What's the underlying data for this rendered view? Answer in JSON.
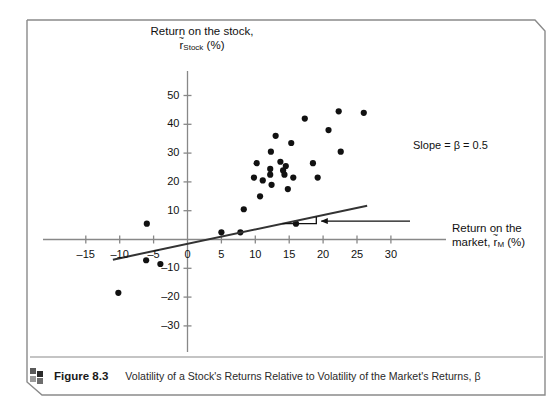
{
  "figure": {
    "icon_name": "blocks-icon",
    "number_label": "Figure 8.3",
    "caption": "Volatility of a Stock's Returns Relative to Volatility of the Market's Returns, β"
  },
  "chart_data": {
    "type": "scatter",
    "title": "",
    "ylabel_line1": "Return on the stock,",
    "ylabel_line2_base": "r",
    "ylabel_line2_sub": "Stock",
    "ylabel_line2_unit": "(%)",
    "xlabel_line1": "Return on the",
    "xlabel_line2_pre": "market, ",
    "xlabel_line2_base": "r",
    "xlabel_line2_sub": "M",
    "xlabel_line2_unit": "(%)",
    "xlabel": "Return on the market, r̃M (%)",
    "ylabel": "Return on the stock, r̃Stock (%)",
    "xlim": [
      -15,
      30
    ],
    "ylim": [
      -30,
      50
    ],
    "xticks": [
      -15,
      -10,
      -5,
      0,
      5,
      10,
      15,
      20,
      25,
      30
    ],
    "yticks": [
      -30,
      -20,
      -10,
      0,
      10,
      20,
      30,
      40,
      50
    ],
    "xticklabels": [
      "–15",
      "–10",
      "–5",
      "0",
      "5",
      "10",
      "15",
      "20",
      "25",
      "30"
    ],
    "yticklabels": [
      "–30",
      "–20",
      "–10",
      "10",
      "20",
      "30",
      "40",
      "50"
    ],
    "grid": false,
    "legend": null,
    "marker_color": "#111111",
    "line_color": "#333333",
    "points": [
      {
        "x": -10.2,
        "y": -18.5
      },
      {
        "x": -6.1,
        "y": -7.2
      },
      {
        "x": -6.0,
        "y": 5.5
      },
      {
        "x": -4.0,
        "y": -8.5
      },
      {
        "x": 5.0,
        "y": 2.5
      },
      {
        "x": 7.8,
        "y": 2.5
      },
      {
        "x": 8.3,
        "y": 10.5
      },
      {
        "x": 9.8,
        "y": 21.5
      },
      {
        "x": 10.2,
        "y": 26.5
      },
      {
        "x": 10.7,
        "y": 15.0
      },
      {
        "x": 11.1,
        "y": 20.5
      },
      {
        "x": 12.2,
        "y": 22.5
      },
      {
        "x": 12.2,
        "y": 24.5
      },
      {
        "x": 12.3,
        "y": 30.5
      },
      {
        "x": 12.4,
        "y": 19.0
      },
      {
        "x": 13.0,
        "y": 36.0
      },
      {
        "x": 13.7,
        "y": 27.0
      },
      {
        "x": 14.1,
        "y": 24.0
      },
      {
        "x": 14.3,
        "y": 22.5
      },
      {
        "x": 14.5,
        "y": 25.5
      },
      {
        "x": 14.8,
        "y": 17.5
      },
      {
        "x": 15.3,
        "y": 33.5
      },
      {
        "x": 15.6,
        "y": 21.5
      },
      {
        "x": 16.0,
        "y": 5.5
      },
      {
        "x": 17.3,
        "y": 42.0
      },
      {
        "x": 18.5,
        "y": 26.5
      },
      {
        "x": 19.2,
        "y": 21.5
      },
      {
        "x": 20.8,
        "y": 38.0
      },
      {
        "x": 22.3,
        "y": 44.5
      },
      {
        "x": 22.6,
        "y": 30.5
      },
      {
        "x": 26.0,
        "y": 44.0
      }
    ],
    "fit_line": {
      "slope": 0.5,
      "intercept": -1.5,
      "x_start": -11.0,
      "x_end": 26.5
    },
    "annotation": {
      "name": "slope-annotation",
      "text": "Slope = β = 0.5",
      "arrow": "left-arrow",
      "triangle_x_start": 14.0,
      "triangle_x_end": 19.0,
      "points_to_x": 19.0
    }
  }
}
